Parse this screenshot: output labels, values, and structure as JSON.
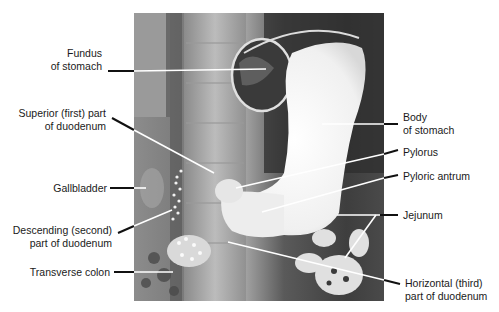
{
  "figure": {
    "type": "annotated barium radiograph",
    "image_frame": {
      "x": 134,
      "y": 13,
      "width": 250,
      "height": 288
    }
  },
  "labels": {
    "left": [
      {
        "id": "fundus",
        "lines": [
          "Fundus",
          "of stomach"
        ]
      },
      {
        "id": "superior_duodenum",
        "lines": [
          "Superior (first) part",
          "of duodenum"
        ]
      },
      {
        "id": "gallbladder",
        "lines": [
          "Gallbladder"
        ]
      },
      {
        "id": "descending_duodenum",
        "lines": [
          "Descending (second)",
          "part of duodenum"
        ]
      },
      {
        "id": "transverse_colon",
        "lines": [
          "Transverse colon"
        ]
      }
    ],
    "right": [
      {
        "id": "body_stomach",
        "lines": [
          "Body",
          "of stomach"
        ]
      },
      {
        "id": "pylorus",
        "lines": [
          "Pylorus"
        ]
      },
      {
        "id": "pyloric_antrum",
        "lines": [
          "Pyloric antrum"
        ]
      },
      {
        "id": "jejunum",
        "lines": [
          "Jejunum"
        ]
      },
      {
        "id": "horizontal_duodenum",
        "lines": [
          "Horizontal (third)",
          "part of duodenum"
        ]
      }
    ]
  },
  "colors": {
    "text": "#1a1a1a",
    "leader_outside": "#111111",
    "leader_inside": "#ffffff",
    "xray_dark": "#3a3a3a",
    "xray_mid": "#8a8a8a",
    "contrast_white": "#f4f4f4"
  }
}
